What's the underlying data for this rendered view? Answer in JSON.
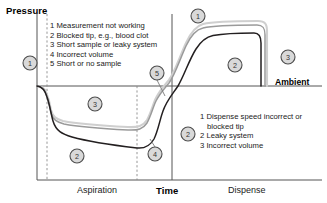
{
  "figure": {
    "axes": {
      "y_title": "Pressure",
      "x_title": "Time",
      "ambient_label": "Ambient"
    },
    "phases": [
      {
        "id": "aspiration",
        "label": "Aspiration"
      },
      {
        "id": "dispense",
        "label": "Dispense"
      }
    ],
    "legends": [
      {
        "id": "aspiration-legend",
        "items": [
          {
            "num": "1",
            "text": "Measurement not working"
          },
          {
            "num": "2",
            "text": "Blocked tip, e.g., blood clot"
          },
          {
            "num": "3",
            "text": "Short sample or leaky system"
          },
          {
            "num": "4",
            "text": "Incorrect volume"
          },
          {
            "num": "5",
            "text": "Short or no sample"
          }
        ]
      },
      {
        "id": "dispense-legend",
        "items": [
          {
            "num": "1",
            "text": "Dispense speed incorrect or"
          },
          {
            "num": "",
            "text": "blocked tip"
          },
          {
            "num": "2",
            "text": "Leaky system"
          },
          {
            "num": "3",
            "text": "Incorrect volume"
          }
        ]
      }
    ],
    "callouts": [
      {
        "id": "callout-1-left",
        "label": "1",
        "x": 30,
        "y": 63
      },
      {
        "id": "callout-3-aspiration",
        "label": "3",
        "x": 95,
        "y": 104
      },
      {
        "id": "callout-2-aspiration",
        "label": "2",
        "x": 77,
        "y": 156
      },
      {
        "id": "callout-4-aspiration",
        "label": "4",
        "x": 155,
        "y": 154
      },
      {
        "id": "callout-5-mid",
        "label": "5",
        "x": 157,
        "y": 73
      },
      {
        "id": "callout-1-dispense",
        "label": "1",
        "x": 198,
        "y": 16
      },
      {
        "id": "callout-2-dispense",
        "label": "2",
        "x": 235,
        "y": 65
      },
      {
        "id": "callout-3-dispense",
        "label": "3",
        "x": 288,
        "y": 57
      },
      {
        "id": "callout-2-legend",
        "label": "2",
        "x": 188,
        "y": 134
      }
    ],
    "colors": {
      "curve_dark": "#231f20",
      "curve_mid": "#9a9a9a",
      "curve_light": "#cfcfcf",
      "axis": "#555555",
      "badge_fill": "#d9d9d9",
      "badge_stroke": "#4d4d4d",
      "text": "#000000"
    },
    "chart_meta": {
      "type": "line",
      "description": "Pipetting pressure trace versus time showing aspiration and dispense phases with three overlaid curves and numbered fault callouts relative to the ambient pressure baseline."
    }
  }
}
